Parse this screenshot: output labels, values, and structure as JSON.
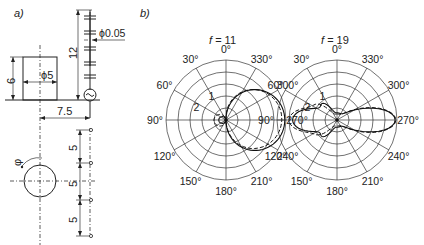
{
  "panel_a": {
    "label": "a)",
    "dim_height_cyl": "6",
    "dim_diameter_cyl": "ϕ5",
    "dim_antenna_length": "12",
    "dim_wire_diameter": "ϕ0.05",
    "dim_offset": "7.5",
    "dim_spacing": [
      "5",
      "5",
      "5"
    ],
    "rotation_symbol": "φ"
  },
  "panel_b": {
    "label": "b)",
    "plots": [
      {
        "title_var": "f",
        "title_value": "= 11",
        "angle_labels": [
          "0°",
          "30°",
          "60°",
          "90°",
          "120°",
          "150°",
          "180°",
          "210°",
          "240°",
          "270°",
          "300°",
          "330°"
        ],
        "curve_labels": [
          "1",
          "2"
        ]
      },
      {
        "title_var": "f",
        "title_value": "= 19",
        "angle_labels": [
          "0°",
          "30°",
          "60°",
          "90°",
          "120°",
          "150°",
          "180°",
          "210°",
          "240°",
          "270°",
          "300°",
          "330°"
        ],
        "curve_labels": [
          "1",
          "2"
        ]
      }
    ]
  }
}
